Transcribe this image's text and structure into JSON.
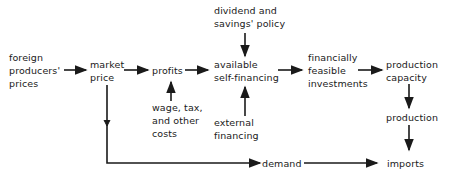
{
  "diagram": {
    "nodes": {
      "foreign_prices": "foreign\nproducers'\nprices",
      "market_price": "market\nprice",
      "profits": "profits",
      "dividend_policy": "dividend and\nsavings' policy",
      "available_self_financing": "available\nself-financing",
      "wage_tax_costs": "wage, tax,\nand other\ncosts",
      "external_financing": "external\nfinancing",
      "financially_feasible": "financially\nfeasible\ninvestments",
      "production_capacity": "production\ncapacity",
      "production": "production",
      "demand": "demand",
      "imports": "imports"
    },
    "edges": [
      [
        "foreign_prices",
        "market_price"
      ],
      [
        "market_price",
        "profits"
      ],
      [
        "profits",
        "available_self_financing"
      ],
      [
        "wage_tax_costs",
        "profits"
      ],
      [
        "dividend_policy",
        "available_self_financing"
      ],
      [
        "external_financing",
        "available_self_financing"
      ],
      [
        "available_self_financing",
        "financially_feasible"
      ],
      [
        "financially_feasible",
        "production_capacity"
      ],
      [
        "production_capacity",
        "production"
      ],
      [
        "production",
        "imports"
      ],
      [
        "market_price",
        "demand"
      ],
      [
        "demand",
        "imports"
      ]
    ]
  }
}
